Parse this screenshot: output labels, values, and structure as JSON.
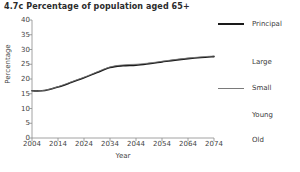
{
  "figure": {
    "title": "4.7c Percentage of population aged 65+"
  },
  "chart_data": {
    "type": "line",
    "title": "4.7c Percentage of population aged 65+",
    "xlabel": "Year",
    "ylabel": "Percentage",
    "xlim": [
      2004,
      2074
    ],
    "ylim": [
      0,
      40
    ],
    "xticks": [
      2004,
      2014,
      2024,
      2034,
      2044,
      2054,
      2064,
      2074
    ],
    "yticks": [
      0,
      5,
      10,
      15,
      20,
      25,
      30,
      35,
      40
    ],
    "grid": false,
    "legend_position": "right",
    "x": [
      2004,
      2009,
      2014,
      2019,
      2024,
      2029,
      2034,
      2039,
      2044,
      2049,
      2054,
      2059,
      2064,
      2069,
      2074
    ],
    "series": [
      {
        "name": "Principal",
        "color": "#1a1a1a",
        "width": 1.6,
        "values": [
          16.0,
          16.1,
          17.3,
          18.8,
          20.4,
          22.2,
          23.9,
          24.5,
          24.7,
          25.2,
          25.8,
          26.4,
          26.9,
          27.3,
          27.6
        ]
      },
      {
        "name": "Large",
        "color": "#ffffff",
        "width": 0.0,
        "values": [
          16.0,
          16.1,
          17.2,
          18.7,
          20.3,
          22.0,
          23.7,
          24.3,
          24.5,
          25.0,
          25.6,
          26.2,
          26.7,
          27.1,
          27.4
        ]
      },
      {
        "name": "Small",
        "color": "#7a7a7a",
        "width": 0.8,
        "values": [
          16.0,
          16.2,
          17.4,
          19.0,
          20.6,
          22.4,
          24.1,
          24.8,
          25.0,
          25.4,
          26.0,
          26.6,
          27.1,
          27.5,
          27.8
        ]
      },
      {
        "name": "Young",
        "color": "#ffffff",
        "width": 0.0,
        "values": [
          16.0,
          16.1,
          17.2,
          18.6,
          20.1,
          21.8,
          23.5,
          24.1,
          24.3,
          24.8,
          25.4,
          26.0,
          26.5,
          26.9,
          27.2
        ]
      },
      {
        "name": "Old",
        "color": "#ffffff",
        "width": 0.0,
        "values": [
          16.0,
          16.2,
          17.4,
          19.0,
          20.7,
          22.5,
          24.2,
          24.9,
          25.1,
          25.6,
          26.2,
          26.8,
          27.3,
          27.7,
          28.0
        ]
      }
    ],
    "legend": [
      {
        "label": "Principal",
        "color": "#1a1a1a",
        "width": 1.8
      },
      {
        "label": "Large",
        "color": "#ffffff",
        "width": 0
      },
      {
        "label": "Small",
        "color": "#7a7a7a",
        "width": 0.9
      },
      {
        "label": "Young",
        "color": "#ffffff",
        "width": 0
      },
      {
        "label": "Old",
        "color": "#ffffff",
        "width": 0
      }
    ]
  },
  "axis": {
    "line_color": "#8a8a8a"
  }
}
